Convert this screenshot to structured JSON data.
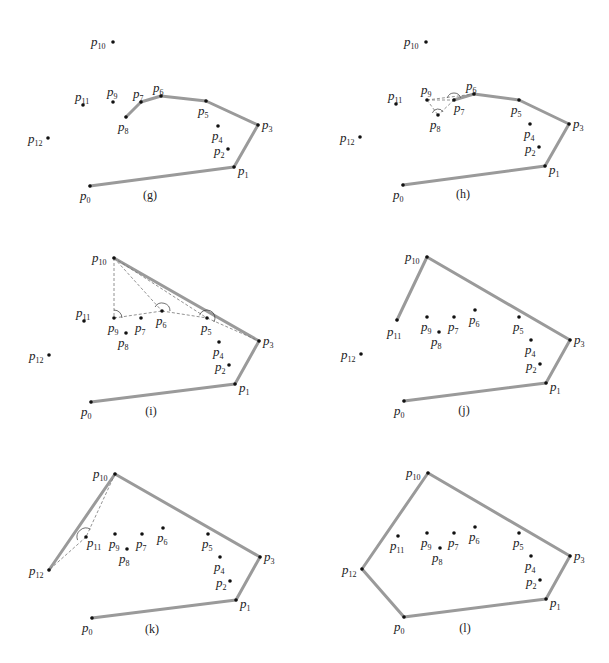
{
  "figure": {
    "hull_color": "#9a9a9a",
    "point_color": "#111111",
    "panels": [
      {
        "id": "g",
        "caption": "(g)",
        "caption_pos": [
          150,
          199
        ],
        "points": {
          "p0": [
            90,
            186
          ],
          "p1": [
            234,
            167
          ],
          "p2": [
            228,
            149
          ],
          "p3": [
            258,
            125
          ],
          "p4": [
            218,
            126
          ],
          "p5": [
            206,
            101
          ],
          "p6": [
            161,
            96
          ],
          "p7": [
            141,
            102
          ],
          "p8": [
            126,
            117
          ],
          "p9": [
            113,
            102
          ],
          "p10": [
            113,
            42
          ],
          "p11": [
            83,
            105
          ],
          "p12": [
            48,
            138
          ]
        },
        "hull": [
          "p0",
          "p1",
          "p3",
          "p5",
          "p6",
          "p7",
          "p8"
        ],
        "dashed": [],
        "arcs": []
      },
      {
        "id": "h",
        "caption": "(h)",
        "caption_pos": [
          463,
          198
        ],
        "points": {
          "p0": [
            403,
            185
          ],
          "p1": [
            545,
            166
          ],
          "p2": [
            539,
            147
          ],
          "p3": [
            569,
            124
          ],
          "p4": [
            530,
            124
          ],
          "p5": [
            519,
            100
          ],
          "p6": [
            474,
            94
          ],
          "p7": [
            454,
            100
          ],
          "p8": [
            438,
            115
          ],
          "p9": [
            427,
            100
          ],
          "p10": [
            426,
            42
          ],
          "p11": [
            396,
            104
          ],
          "p12": [
            360,
            137
          ]
        },
        "hull": [
          "p0",
          "p1",
          "p3",
          "p5",
          "p6",
          "p7"
        ],
        "dashed": [
          [
            "p9",
            "p7"
          ],
          [
            "p7",
            "p8"
          ],
          [
            "p9",
            "p8"
          ],
          [
            "p9",
            "p6"
          ]
        ],
        "arcs": [
          {
            "at": "p7",
            "r": 7,
            "start": 200,
            "end": 340
          },
          {
            "at": "p8",
            "r": 6,
            "start": 200,
            "end": 330
          }
        ]
      },
      {
        "id": "i",
        "caption": "(i)",
        "caption_pos": [
          151,
          415
        ],
        "points": {
          "p0": [
            91,
            402
          ],
          "p1": [
            235,
            384
          ],
          "p2": [
            229,
            365
          ],
          "p3": [
            259,
            341
          ],
          "p4": [
            219,
            342
          ],
          "p5": [
            207,
            318
          ],
          "p6": [
            162,
            311
          ],
          "p7": [
            141,
            318
          ],
          "p8": [
            126,
            333
          ],
          "p9": [
            114,
            318
          ],
          "p10": [
            114,
            258
          ],
          "p11": [
            84,
            321
          ],
          "p12": [
            49,
            355
          ]
        },
        "hull": [
          "p0",
          "p1",
          "p3",
          "p10"
        ],
        "dashed": [
          [
            "p10",
            "p9"
          ],
          [
            "p10",
            "p6"
          ],
          [
            "p10",
            "p5"
          ],
          [
            "p9",
            "p6"
          ],
          [
            "p6",
            "p5"
          ],
          [
            "p5",
            "p3"
          ]
        ],
        "arcs": [
          {
            "at": "p9",
            "r": 8,
            "start": 270,
            "end": 360
          },
          {
            "at": "p6",
            "r": 8,
            "start": 210,
            "end": 360
          },
          {
            "at": "p5",
            "r": 8,
            "start": 200,
            "end": 390
          }
        ]
      },
      {
        "id": "j",
        "caption": "(j)",
        "caption_pos": [
          464,
          414
        ],
        "points": {
          "p0": [
            404,
            401
          ],
          "p1": [
            546,
            383
          ],
          "p2": [
            540,
            364
          ],
          "p3": [
            570,
            340
          ],
          "p4": [
            531,
            340
          ],
          "p5": [
            519,
            317
          ],
          "p6": [
            475,
            310
          ],
          "p7": [
            454,
            317
          ],
          "p8": [
            439,
            332
          ],
          "p9": [
            427,
            317
          ],
          "p10": [
            427,
            257
          ],
          "p11": [
            397,
            320
          ],
          "p12": [
            361,
            354
          ]
        },
        "hull": [
          "p0",
          "p1",
          "p3",
          "p10",
          "p11"
        ],
        "dashed": [],
        "arcs": []
      },
      {
        "id": "k",
        "caption": "(k)",
        "caption_pos": [
          152,
          633
        ],
        "points": {
          "p0": [
            92,
            618
          ],
          "p1": [
            236,
            600
          ],
          "p2": [
            230,
            581
          ],
          "p3": [
            260,
            557
          ],
          "p4": [
            220,
            557
          ],
          "p5": [
            208,
            534
          ],
          "p6": [
            163,
            528
          ],
          "p7": [
            142,
            534
          ],
          "p8": [
            127,
            549
          ],
          "p9": [
            115,
            534
          ],
          "p10": [
            115,
            474
          ],
          "p11": [
            86,
            537
          ],
          "p12": [
            49,
            570
          ]
        },
        "hull": [
          "p0",
          "p1",
          "p3",
          "p10",
          "p12"
        ],
        "dashed": [
          [
            "p10",
            "p11"
          ],
          [
            "p11",
            "p12"
          ]
        ],
        "arcs": [
          {
            "at": "p11",
            "r": 9,
            "start": 160,
            "end": 300
          }
        ]
      },
      {
        "id": "l",
        "caption": "(l)",
        "caption_pos": [
          465,
          632
        ],
        "points": {
          "p0": [
            404,
            617
          ],
          "p1": [
            546,
            599
          ],
          "p2": [
            540,
            580
          ],
          "p3": [
            570,
            556
          ],
          "p4": [
            531,
            556
          ],
          "p5": [
            519,
            533
          ],
          "p6": [
            475,
            527
          ],
          "p7": [
            454,
            533
          ],
          "p8": [
            440,
            548
          ],
          "p9": [
            427,
            533
          ],
          "p10": [
            428,
            473
          ],
          "p11": [
            398,
            536
          ],
          "p12": [
            362,
            569
          ]
        },
        "hull": [
          "p0",
          "p1",
          "p3",
          "p10",
          "p12",
          "p0"
        ],
        "dashed": [],
        "arcs": []
      }
    ],
    "label_offsets": {
      "p0": [
        -10,
        14
      ],
      "p1": [
        4,
        8
      ],
      "p2": [
        -14,
        6
      ],
      "p3": [
        4,
        4
      ],
      "p4": [
        -6,
        14
      ],
      "p5": [
        -8,
        14
      ],
      "p6": [
        -8,
        -4
      ],
      "p7": [
        -8,
        -4
      ],
      "p8": [
        -8,
        14
      ],
      "p9": [
        -6,
        -6
      ],
      "p10": [
        -22,
        4
      ],
      "p11": [
        -8,
        -4
      ],
      "p12": [
        -20,
        5
      ]
    },
    "label_offsets_variant": {
      "j": {
        "p11": [
          -10,
          16
        ],
        "p9": [
          -6,
          14
        ],
        "p7": [
          -6,
          14
        ],
        "p6": [
          -6,
          14
        ],
        "p5": [
          -6,
          14
        ]
      },
      "k": {
        "p11": [
          1,
          10
        ],
        "p9": [
          -6,
          14
        ],
        "p7": [
          -6,
          14
        ],
        "p6": [
          -6,
          14
        ],
        "p5": [
          -6,
          14
        ],
        "p12": [
          -20,
          5
        ]
      },
      "l": {
        "p11": [
          -8,
          14
        ],
        "p9": [
          -6,
          14
        ],
        "p7": [
          -6,
          14
        ],
        "p6": [
          -6,
          14
        ],
        "p5": [
          -6,
          14
        ]
      },
      "i": {
        "p9": [
          -6,
          14
        ],
        "p7": [
          -6,
          14
        ],
        "p6": [
          -6,
          14
        ],
        "p5": [
          -6,
          14
        ]
      },
      "h": {
        "p7": [
          0,
          12
        ],
        "p9": [
          -6,
          -6
        ]
      }
    }
  }
}
